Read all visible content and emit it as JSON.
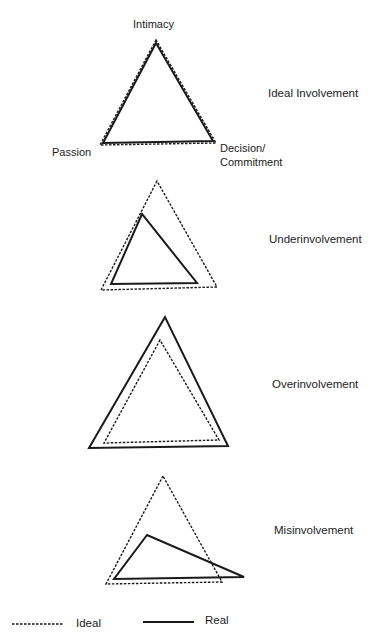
{
  "vertex_labels": {
    "intimacy": "Intimacy",
    "passion": "Passion",
    "decision_line1": "Decision/",
    "decision_line2": "Commitment"
  },
  "panels": [
    {
      "title": "Ideal Involvement",
      "ideal": [
        [
          156,
          40
        ],
        [
          100,
          145
        ],
        [
          216,
          143
        ]
      ],
      "real": [
        [
          156,
          43
        ],
        [
          103,
          143
        ],
        [
          213,
          141
        ]
      ]
    },
    {
      "title": "Underinvolvement",
      "ideal": [
        [
          157,
          181
        ],
        [
          101,
          290
        ],
        [
          217,
          287
        ]
      ],
      "real": [
        [
          142,
          214
        ],
        [
          111,
          284
        ],
        [
          197,
          283
        ]
      ]
    },
    {
      "title": "Overinvolvement",
      "ideal": [
        [
          160,
          340
        ],
        [
          104,
          443
        ],
        [
          219,
          440
        ]
      ],
      "real": [
        [
          165,
          317
        ],
        [
          89,
          448
        ],
        [
          228,
          446
        ]
      ]
    },
    {
      "title": "Misinvolvement",
      "ideal": [
        [
          163,
          476
        ],
        [
          106,
          584
        ],
        [
          222,
          582
        ]
      ],
      "real": [
        [
          147,
          535
        ],
        [
          114,
          579
        ],
        [
          244,
          577
        ]
      ]
    }
  ],
  "legend": {
    "ideal_label": "Ideal",
    "real_label": "Real"
  },
  "colors": {
    "stroke": "#1a1a1a",
    "background": "#ffffff"
  }
}
